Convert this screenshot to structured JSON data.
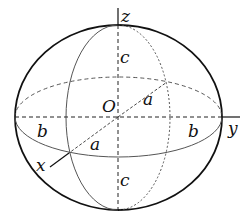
{
  "diagram": {
    "labels": {
      "z_axis": "z",
      "y_axis": "y",
      "x_axis": "x",
      "origin": "O",
      "c_upper": "c",
      "c_lower": "c",
      "b_left": "b",
      "b_right": "b",
      "a_back": "a",
      "a_front": "a"
    },
    "colors": {
      "stroke": "#111111",
      "thin_stroke": "#555555",
      "background": "#ffffff"
    }
  }
}
